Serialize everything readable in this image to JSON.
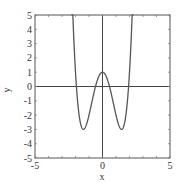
{
  "chart_data": {
    "type": "line",
    "title": "",
    "xlabel": "x",
    "ylabel": "y",
    "xlim": [
      -5,
      5
    ],
    "ylim": [
      -5,
      5
    ],
    "grid": false,
    "legend": null,
    "x_ticks": [
      "-5",
      "0",
      "5"
    ],
    "y_ticks": [
      "-5",
      "-4",
      "-3",
      "-2",
      "-1",
      "0",
      "1",
      "2",
      "3",
      "4",
      "5"
    ],
    "series": [
      {
        "name": "y = x^4 - 4x^2 + 1",
        "color": "#555555",
        "x": [
          -2.1,
          -2.0,
          -1.8,
          -1.6,
          -1.414,
          -1.2,
          -1.0,
          -0.8,
          -0.6,
          -0.4,
          -0.2,
          0,
          0.2,
          0.4,
          0.6,
          0.8,
          1.0,
          1.2,
          1.414,
          1.6,
          1.8,
          2.0,
          2.1
        ],
        "y": [
          2.8,
          1.0,
          -1.46,
          -2.69,
          -3.0,
          -2.69,
          -2.0,
          -1.15,
          -0.31,
          0.39,
          0.84,
          1.0,
          0.84,
          0.39,
          -0.31,
          -1.15,
          -2.0,
          -2.69,
          -3.0,
          -2.69,
          -1.46,
          1.0,
          2.8
        ]
      }
    ],
    "reference_lines": {
      "x0": true,
      "y0": true
    }
  }
}
